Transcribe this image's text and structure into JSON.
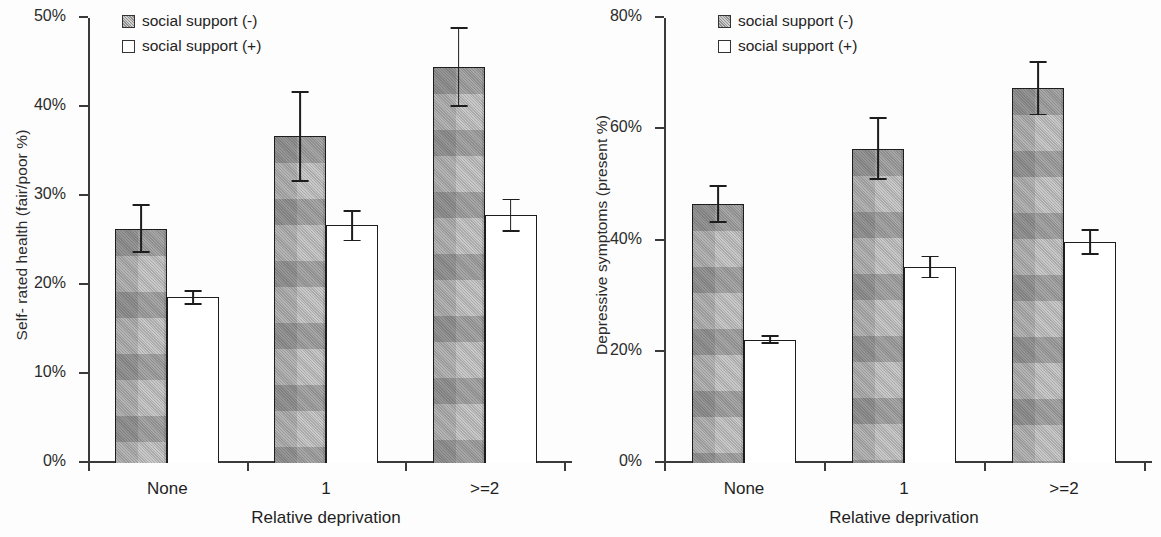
{
  "figure": {
    "panels": [
      {
        "id": "self-rated-health",
        "ylabel": "Self- rated health (fair/poor %)",
        "xlabel": "Relative deprivation",
        "yticks": [
          "0%",
          "10%",
          "20%",
          "30%",
          "40%",
          "50%"
        ],
        "ytick_values": [
          0,
          10,
          20,
          30,
          40,
          50
        ],
        "ymax": 50,
        "categories": [
          "None",
          "1",
          ">=2"
        ],
        "legend": [
          {
            "label": "social support (-)",
            "swatch": "filled-pattern-swatch"
          },
          {
            "label": "social support (+)",
            "swatch": "open-white-swatch"
          }
        ]
      },
      {
        "id": "depressive-symptoms",
        "ylabel": "Depressive symptoms  (present %)",
        "xlabel": "Relative deprivation",
        "yticks": [
          "0%",
          "20%",
          "40%",
          "60%",
          "80%"
        ],
        "ytick_values": [
          0,
          20,
          40,
          60,
          80
        ],
        "ymax": 80,
        "categories": [
          "None",
          "1",
          ">=2"
        ],
        "legend": [
          {
            "label": "social support (-)",
            "swatch": "filled-pattern-swatch"
          },
          {
            "label": "social support (+)",
            "swatch": "open-white-swatch"
          }
        ]
      }
    ]
  },
  "chart_data": [
    {
      "type": "bar",
      "title": "",
      "xlabel": "Relative deprivation",
      "ylabel": "Self- rated health (fair/poor %)",
      "categories": [
        "None",
        "1",
        ">=2"
      ],
      "ylim": [
        0,
        50
      ],
      "yticks": [
        0,
        10,
        20,
        30,
        40,
        50
      ],
      "grid": false,
      "legend_position": "top-left",
      "series": [
        {
          "name": "social support (-)",
          "values": [
            26.3,
            36.7,
            44.5
          ],
          "err_low": [
            23.6,
            31.6,
            40.0
          ],
          "err_high": [
            29.1,
            41.8,
            49.0
          ]
        },
        {
          "name": "social support (+)",
          "values": [
            18.6,
            26.7,
            27.9
          ],
          "err_low": [
            17.8,
            24.9,
            26.0
          ],
          "err_high": [
            19.4,
            28.4,
            29.7
          ]
        }
      ]
    },
    {
      "type": "bar",
      "title": "",
      "xlabel": "Relative deprivation",
      "ylabel": "Depressive symptoms  (present %)",
      "categories": [
        "None",
        "1",
        ">=2"
      ],
      "ylim": [
        0,
        80
      ],
      "yticks": [
        0,
        20,
        40,
        60,
        80
      ],
      "grid": false,
      "legend_position": "top-left",
      "series": [
        {
          "name": "social support (-)",
          "values": [
            46.6,
            56.5,
            67.5
          ],
          "err_low": [
            43.2,
            50.9,
            62.5
          ],
          "err_high": [
            49.9,
            62.2,
            72.2
          ]
        },
        {
          "name": "social support (+)",
          "values": [
            22.2,
            35.3,
            39.7
          ],
          "err_low": [
            21.4,
            33.2,
            37.4
          ],
          "err_high": [
            23.0,
            37.3,
            42.0
          ]
        }
      ]
    }
  ],
  "colors": {
    "bar_negative_fill": "#b4b4b4",
    "bar_negative_pattern": "#8a8a8a",
    "bar_positive_fill": "#ffffff",
    "bar_outline": "#1d1d1d",
    "axis": "#3a3a3a",
    "text": "#232323",
    "background": "#fdfdfd"
  }
}
